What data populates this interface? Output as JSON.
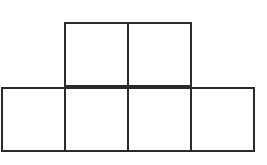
{
  "diagram": {
    "stroke_color": "#2a2a2a",
    "fill_color": "#ffffff",
    "squares": [
      {
        "row": 0,
        "col": 1,
        "x": 65,
        "y": 23,
        "size": 63
      },
      {
        "row": 0,
        "col": 2,
        "x": 128,
        "y": 23,
        "size": 63
      },
      {
        "row": 1,
        "col": 0,
        "x": 2,
        "y": 88,
        "size": 63
      },
      {
        "row": 1,
        "col": 1,
        "x": 65,
        "y": 88,
        "size": 63
      },
      {
        "row": 1,
        "col": 2,
        "x": 128,
        "y": 88,
        "size": 63
      },
      {
        "row": 1,
        "col": 3,
        "x": 191,
        "y": 88,
        "size": 63
      }
    ]
  }
}
